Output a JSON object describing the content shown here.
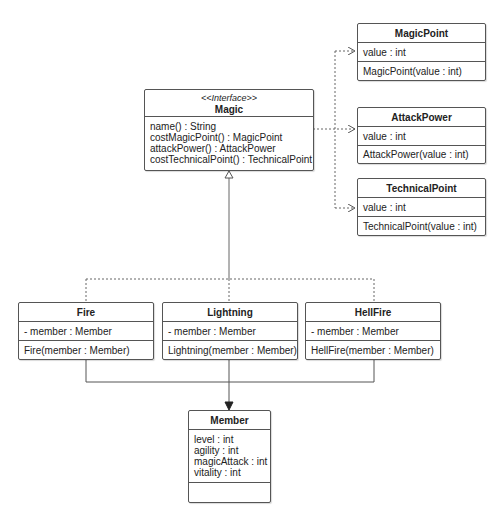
{
  "diagram": {
    "type": "uml-class-diagram",
    "classes": {
      "magic": {
        "stereotype": "<<Interface>>",
        "name": "Magic",
        "attributes": [],
        "operations": [
          "name() : String",
          "costMagicPoint() : MagicPoint",
          "attackPower() : AttackPower",
          "costTechnicalPoint() : TechnicalPoint"
        ]
      },
      "magicPoint": {
        "name": "MagicPoint",
        "attributes": [
          "value : int"
        ],
        "operations": [
          "MagicPoint(value : int)"
        ]
      },
      "attackPower": {
        "name": "AttackPower",
        "attributes": [
          "value : int"
        ],
        "operations": [
          "AttackPower(value : int)"
        ]
      },
      "technicalPoint": {
        "name": "TechnicalPoint",
        "attributes": [
          "value : int"
        ],
        "operations": [
          "TechnicalPoint(value : int)"
        ]
      },
      "fire": {
        "name": "Fire",
        "attributes": [
          "- member : Member"
        ],
        "operations": [
          "Fire(member : Member)"
        ]
      },
      "lightning": {
        "name": "Lightning",
        "attributes": [
          "- member : Member"
        ],
        "operations": [
          "Lightning(member : Member)"
        ]
      },
      "hellFire": {
        "name": "HellFire",
        "attributes": [
          "- member : Member"
        ],
        "operations": [
          "HellFire(member : Member)"
        ]
      },
      "member": {
        "name": "Member",
        "attributes": [
          "level : int",
          "agility : int",
          "magicAttack : int",
          "vitality : int"
        ],
        "operations": []
      }
    },
    "relationships": [
      {
        "from": "Magic",
        "to": "MagicPoint",
        "kind": "dependency"
      },
      {
        "from": "Magic",
        "to": "AttackPower",
        "kind": "dependency"
      },
      {
        "from": "Magic",
        "to": "TechnicalPoint",
        "kind": "dependency"
      },
      {
        "from": "Fire",
        "to": "Magic",
        "kind": "realization"
      },
      {
        "from": "Lightning",
        "to": "Magic",
        "kind": "realization"
      },
      {
        "from": "HellFire",
        "to": "Magic",
        "kind": "realization"
      },
      {
        "from": "Fire",
        "to": "Member",
        "kind": "association"
      },
      {
        "from": "Lightning",
        "to": "Member",
        "kind": "association"
      },
      {
        "from": "HellFire",
        "to": "Member",
        "kind": "association"
      }
    ],
    "colors": {
      "border": "#555555",
      "line": "#555555",
      "background": "#ffffff"
    }
  }
}
